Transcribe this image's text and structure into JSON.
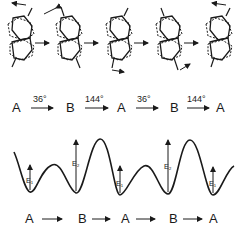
{
  "molecules": [
    {
      "index": 1,
      "conformer": "A"
    },
    {
      "index": 2,
      "conformer": "B"
    },
    {
      "index": 3,
      "conformer": "A"
    },
    {
      "index": 4,
      "conformer": "B"
    },
    {
      "index": 5,
      "conformer": "A"
    }
  ],
  "rotation_sequence": {
    "states": [
      "A",
      "B",
      "A",
      "B",
      "A"
    ],
    "steps": [
      "36°",
      "144°",
      "36°",
      "144°"
    ]
  },
  "energy_profile": {
    "barriers": [
      {
        "label": "E₁",
        "relative_height": "low"
      },
      {
        "label": "E₂",
        "relative_height": "high"
      },
      {
        "label": "E₁",
        "relative_height": "low"
      },
      {
        "label": "E₂",
        "relative_height": "high"
      },
      {
        "label": "E₁",
        "relative_height": "low"
      }
    ]
  },
  "reaction_sequence": {
    "states": [
      "A",
      "B",
      "A",
      "B",
      "A"
    ]
  }
}
